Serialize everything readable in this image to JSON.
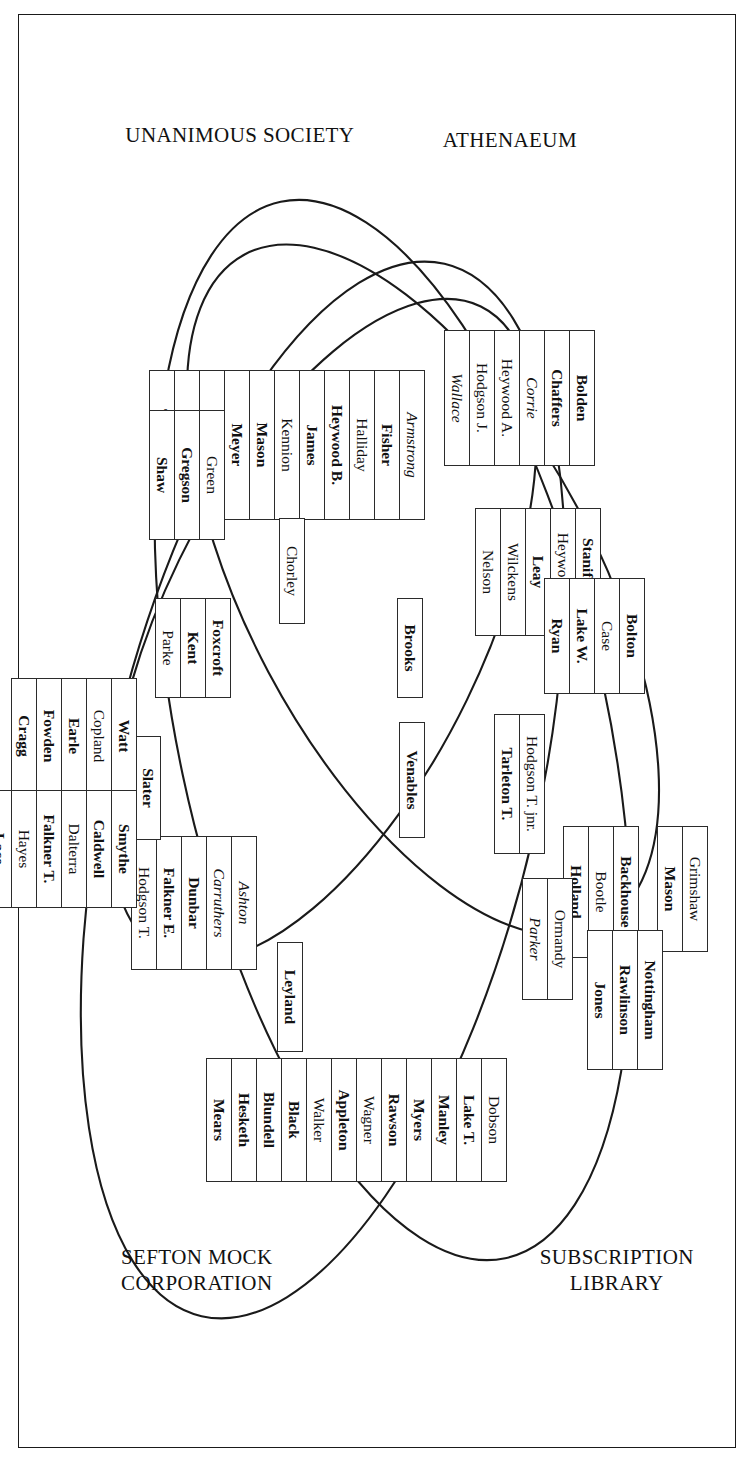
{
  "diagram": {
    "type": "venn-four-set",
    "title": "",
    "set_labels": [
      {
        "name": "athenaeum",
        "text": "ATHENAEUM"
      },
      {
        "name": "subscription-library",
        "text": "SUBSCRIPTION\nLIBRARY"
      },
      {
        "name": "unanimous-society",
        "text": "UNANIMOUS SOCIETY"
      },
      {
        "name": "sefton-mock-corporation",
        "text": "SEFTON MOCK\nCORPORATION"
      }
    ],
    "groups": [
      {
        "name": "athenaeum-only-upper",
        "region": "athenaeum",
        "names": [
          {
            "text": "Bolden",
            "style": "bold"
          },
          {
            "text": "Chaffers",
            "style": "bold"
          },
          {
            "text": "Corrie",
            "style": "italic"
          },
          {
            "text": "Heywood A.",
            "style": "normal"
          },
          {
            "text": "Hodgson J.",
            "style": "normal"
          },
          {
            "text": "Wallace",
            "style": "italic"
          }
        ]
      },
      {
        "name": "athenaeum-subscription-library",
        "region": "athenaeum ∩ subscription-library",
        "names": [
          {
            "text": "Armstrong",
            "style": "italic"
          },
          {
            "text": "Fisher",
            "style": "bold"
          },
          {
            "text": "Halliday",
            "style": "normal"
          },
          {
            "text": "Heywood B.",
            "style": "bold"
          },
          {
            "text": "James",
            "style": "bold"
          },
          {
            "text": "Kennion",
            "style": "normal"
          },
          {
            "text": "Mason",
            "style": "bold"
          },
          {
            "text": "Meyer",
            "style": "bold"
          },
          {
            "text": "Nicholson",
            "style": "normal"
          },
          {
            "text": "Rathbone",
            "style": "normal"
          },
          {
            "text": "Tarleton J.",
            "style": "bold"
          }
        ]
      },
      {
        "name": "subscription-library-only",
        "region": "subscription-library",
        "names": [
          {
            "text": "Green",
            "style": "normal"
          },
          {
            "text": "Gregson",
            "style": "bold"
          },
          {
            "text": "Shaw",
            "style": "bold"
          }
        ]
      },
      {
        "name": "athenaeum-unanimous",
        "region": "athenaeum ∩ unanimous-society",
        "names": [
          {
            "text": "Staniforth",
            "style": "bold"
          },
          {
            "text": "Heywood R.",
            "style": "normal"
          },
          {
            "text": "Leay",
            "style": "bold"
          },
          {
            "text": "Wilckens",
            "style": "normal"
          },
          {
            "text": "Nelson",
            "style": "normal"
          }
        ]
      },
      {
        "name": "unanimous-society-only-upper",
        "region": "unanimous-society",
        "names": [
          {
            "text": "Bolton",
            "style": "bold"
          },
          {
            "text": "Case",
            "style": "normal"
          },
          {
            "text": "Lake W.",
            "style": "bold"
          },
          {
            "text": "Ryan",
            "style": "bold"
          }
        ]
      },
      {
        "name": "centre-brooks",
        "region": "athenaeum ∩ subscription-library ∩ sefton",
        "names": [
          {
            "text": "Brooks",
            "style": "bold"
          }
        ]
      },
      {
        "name": "centre-chorley",
        "region": "subscription-library ∩ sefton",
        "names": [
          {
            "text": "Chorley",
            "style": "normal"
          }
        ]
      },
      {
        "name": "sefton-foxcroft-group",
        "region": "subscription-library ∩ sefton",
        "names": [
          {
            "text": "Foxcroft",
            "style": "bold"
          },
          {
            "text": "Kent",
            "style": "bold"
          },
          {
            "text": "Parke",
            "style": "normal"
          }
        ]
      },
      {
        "name": "centre-venables",
        "region": "all-four",
        "names": [
          {
            "text": "Venables",
            "style": "bold"
          }
        ]
      },
      {
        "name": "hodgson-tarleton-pair",
        "region": "athenaeum ∩ unanimous-society ∩ sefton",
        "names": [
          {
            "text": "Hodgson T. jnr.",
            "style": "normal"
          },
          {
            "text": "Tarleton T.",
            "style": "bold"
          }
        ]
      },
      {
        "name": "unanimous-backhouse-group",
        "region": "unanimous-society",
        "names": [
          {
            "text": "Backhouse",
            "style": "bold"
          },
          {
            "text": "Bootle",
            "style": "normal"
          },
          {
            "text": "Holland",
            "style": "bold"
          }
        ]
      },
      {
        "name": "unanimous-grimshaw-group",
        "region": "unanimous-society",
        "names": [
          {
            "text": "Grimshaw",
            "style": "normal"
          },
          {
            "text": "Mason",
            "style": "bold"
          }
        ]
      },
      {
        "name": "unanimous-ormandy-group",
        "region": "unanimous-society ∩ sefton",
        "names": [
          {
            "text": "Ormandy",
            "style": "normal"
          },
          {
            "text": "Parker",
            "style": "italic"
          }
        ]
      },
      {
        "name": "unanimous-nottingham-group",
        "region": "unanimous-society ∩ sefton",
        "names": [
          {
            "text": "Nottingham",
            "style": "bold"
          },
          {
            "text": "Rawlinson",
            "style": "bold"
          },
          {
            "text": "Jones",
            "style": "bold"
          }
        ]
      },
      {
        "name": "centre-leyland",
        "region": "sefton",
        "names": [
          {
            "text": "Leyland",
            "style": "bold"
          }
        ]
      },
      {
        "name": "sefton-ashton-group",
        "region": "sefton ∩ subscription-library",
        "names": [
          {
            "text": "Ashton",
            "style": "italic"
          },
          {
            "text": "Carruthers",
            "style": "italic"
          },
          {
            "text": "Dunbar",
            "style": "bold"
          },
          {
            "text": "Falkner E.",
            "style": "bold"
          },
          {
            "text": "Hodgson T.",
            "style": "normal"
          }
        ]
      },
      {
        "name": "sefton-slater-column",
        "region": "sefton",
        "names": [
          {
            "text": "Slater",
            "style": "bold"
          }
        ]
      },
      {
        "name": "sefton-watt-row",
        "region": "sefton",
        "names": [
          {
            "text": "Watt",
            "style": "bold"
          },
          {
            "text": "Copland",
            "style": "normal"
          },
          {
            "text": "Earle",
            "style": "bold"
          },
          {
            "text": "Fowden",
            "style": "bold"
          },
          {
            "text": "Cragg",
            "style": "bold"
          }
        ]
      },
      {
        "name": "sefton-smythe-row",
        "region": "sefton",
        "names": [
          {
            "text": "Smythe",
            "style": "bold"
          },
          {
            "text": "Caldwell",
            "style": "bold"
          },
          {
            "text": "Dalterra",
            "style": "normal"
          },
          {
            "text": "Falkner T.",
            "style": "bold"
          },
          {
            "text": "Hayes",
            "style": "normal"
          },
          {
            "text": "Lace",
            "style": "bold"
          }
        ]
      },
      {
        "name": "sefton-only-bottom",
        "region": "sefton-mock-corporation",
        "names": [
          {
            "text": "Dobson",
            "style": "normal"
          },
          {
            "text": "Lake T.",
            "style": "bold"
          },
          {
            "text": "Manley",
            "style": "bold"
          },
          {
            "text": "Myers",
            "style": "bold"
          },
          {
            "text": "Rawson",
            "style": "bold"
          },
          {
            "text": "Wagner",
            "style": "normal"
          },
          {
            "text": "Appleton",
            "style": "bold"
          },
          {
            "text": "Walker",
            "style": "normal"
          },
          {
            "text": "Black",
            "style": "bold"
          },
          {
            "text": "Blundell",
            "style": "bold"
          },
          {
            "text": "Hesketh",
            "style": "bold"
          },
          {
            "text": "Mears",
            "style": "bold"
          }
        ]
      }
    ],
    "colors": {
      "ink": "#1a1a1a",
      "paper": "#ffffff",
      "box_border": "#2b2b2b"
    }
  }
}
